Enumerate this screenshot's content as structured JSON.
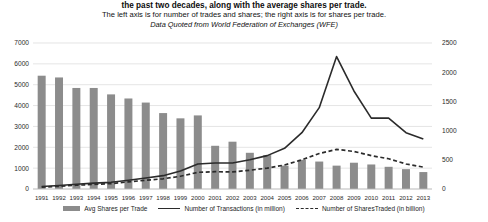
{
  "title": {
    "line1": "the past two decades, along with the average shares per trade.",
    "line2": "The left axis is for number of trades and shares; the right axis is for shares per trade.",
    "line3": "Data Quoted from World Federation of Exchanges (WFE)"
  },
  "legend": {
    "bar_label": "Avg Shares per Trade",
    "line_label": "Number of Transactions (in million)",
    "dash_label": "Number of SharesTraded (in billion)"
  },
  "colors": {
    "bar": "#8c8c8c",
    "line": "#2b2b2b",
    "dash": "#2b2b2b",
    "grid": "#d9d9d9",
    "text": "#1a1a1a",
    "background": "#ffffff"
  },
  "chart_data": {
    "type": "bar",
    "title": "the past two decades, along with the average shares per trade.",
    "subtitle": "The left axis is for number of trades and shares; the right axis is for shares per trade.",
    "annotation": "Data Quoted from World Federation of Exchanges (WFE)",
    "xlabel": "",
    "ylabel": "",
    "grid": true,
    "legend_position": "bottom",
    "categories": [
      "1991",
      "1992",
      "1993",
      "1994",
      "1995",
      "1996",
      "1997",
      "1998",
      "1999",
      "2000",
      "2001",
      "2002",
      "2003",
      "2004",
      "2005",
      "2006",
      "2007",
      "2008",
      "2009",
      "2010",
      "2011",
      "2012",
      "2013"
    ],
    "left_axis": {
      "name": "Number of trades and shares",
      "ticks": [
        0,
        1000,
        2000,
        3000,
        4000,
        5000,
        6000,
        7000
      ],
      "ylim": [
        0,
        7000
      ]
    },
    "right_axis": {
      "name": "Shares per trade",
      "ticks": [
        0,
        500,
        1000,
        1500,
        2000,
        2500
      ],
      "ylim": [
        0,
        2500
      ]
    },
    "series": [
      {
        "name": "Avg Shares per Trade",
        "type": "bar",
        "axis": "right",
        "unit": "shares per trade",
        "values": [
          1940,
          1910,
          1730,
          1730,
          1620,
          1550,
          1480,
          1300,
          1210,
          1260,
          740,
          810,
          620,
          580,
          400,
          500,
          470,
          400,
          450,
          420,
          380,
          340,
          290
        ]
      },
      {
        "name": "Number of Transactions (in million)",
        "type": "line",
        "axis": "left",
        "unit": "million",
        "values": [
          120,
          170,
          230,
          280,
          320,
          420,
          530,
          640,
          860,
          1200,
          1250,
          1250,
          1400,
          1600,
          1950,
          2700,
          3900,
          6350,
          4700,
          3400,
          3400,
          2700,
          2400
        ]
      },
      {
        "name": "Number of SharesTraded (in billion)",
        "type": "line-dashed",
        "axis": "left",
        "unit": "billion",
        "values": [
          90,
          130,
          180,
          220,
          260,
          340,
          420,
          490,
          610,
          800,
          830,
          820,
          900,
          1000,
          1150,
          1400,
          1700,
          1900,
          1800,
          1600,
          1450,
          1200,
          1050
        ]
      }
    ]
  }
}
